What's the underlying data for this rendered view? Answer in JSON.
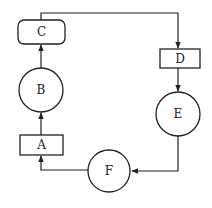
{
  "diagram": {
    "type": "flow-cycle",
    "colors": {
      "stroke": "#222222",
      "background": "#ffffff"
    },
    "nodes": [
      {
        "id": "A",
        "label": "A",
        "shape": "rectangle"
      },
      {
        "id": "B",
        "label": "B",
        "shape": "circle"
      },
      {
        "id": "C",
        "label": "C",
        "shape": "rounded-rectangle"
      },
      {
        "id": "D",
        "label": "D",
        "shape": "rectangle"
      },
      {
        "id": "E",
        "label": "E",
        "shape": "circle"
      },
      {
        "id": "F",
        "label": "F",
        "shape": "circle"
      }
    ],
    "edges": [
      {
        "from": "A",
        "to": "B"
      },
      {
        "from": "B",
        "to": "C"
      },
      {
        "from": "C",
        "to": "D"
      },
      {
        "from": "D",
        "to": "E"
      },
      {
        "from": "E",
        "to": "F"
      },
      {
        "from": "F",
        "to": "A"
      }
    ]
  }
}
